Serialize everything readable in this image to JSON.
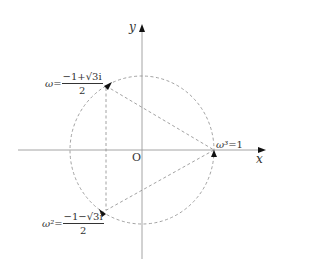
{
  "diagram": {
    "axes": {
      "x_label": "x",
      "y_label": "y",
      "origin_label": "O"
    },
    "points": [
      {
        "name": "omega",
        "lhs": "ω",
        "equals": "=",
        "numerator": "−1+√3i",
        "denominator": "2"
      },
      {
        "name": "omega-squared",
        "lhs": "ω²",
        "equals": "=",
        "numerator": "−1−√3i",
        "denominator": "2"
      },
      {
        "name": "omega-cubed",
        "lhs": "ω³",
        "equals": "=",
        "value": "1"
      }
    ],
    "colors": {
      "axis": "#999999",
      "dashed": "#888888",
      "text": "#333333",
      "arrow": "#111111"
    }
  }
}
